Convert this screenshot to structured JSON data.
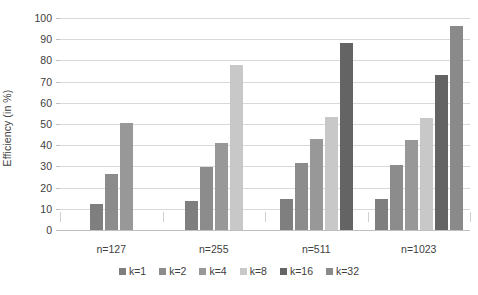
{
  "chart_data": {
    "type": "bar",
    "title": "",
    "subtitle": "",
    "xlabel": "",
    "ylabel": "Efficiency (in %)",
    "ylim": [
      0,
      100
    ],
    "ytick_step": 10,
    "ytick_labels": [
      "100",
      "90",
      "80",
      "70",
      "60",
      "50",
      "40",
      "30",
      "20",
      "10",
      "0"
    ],
    "grid": "horizontal",
    "legend_position": "bottom-center",
    "categories": [
      "n=127",
      "n=255",
      "n=511",
      "n=1023"
    ],
    "series": [
      {
        "name": "k=1",
        "color": "#7f7f7f",
        "values": [
          12.5,
          13.7,
          14.6,
          14.5
        ]
      },
      {
        "name": "k=2",
        "color": "#8c8c8c",
        "values": [
          26.6,
          29.7,
          31.4,
          30.5
        ]
      },
      {
        "name": "k=4",
        "color": "#989898",
        "values": [
          50.4,
          41.0,
          43.1,
          42.6
        ]
      },
      {
        "name": "k=8",
        "color": "#c8c8c8",
        "values": [
          null,
          77.8,
          53.5,
          53.0
        ]
      },
      {
        "name": "k=16",
        "color": "#646464",
        "values": [
          null,
          null,
          88.3,
          72.9
        ]
      },
      {
        "name": "k=32",
        "color": "#8a8a8a",
        "values": [
          null,
          null,
          null,
          96.1
        ]
      }
    ]
  },
  "axis": {
    "y_title": "Efficiency (in %)"
  },
  "legend": {
    "items": [
      {
        "label": "k=1"
      },
      {
        "label": "k=2"
      },
      {
        "label": "k=4"
      },
      {
        "label": "k=8"
      },
      {
        "label": "k=16"
      },
      {
        "label": "k=32"
      }
    ]
  },
  "colors": {
    "gridline": "#d9d9d9",
    "axis": "#bfbfbf",
    "text": "#404040",
    "background": "#ffffff"
  }
}
